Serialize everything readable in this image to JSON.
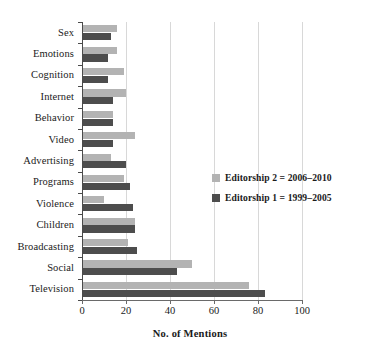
{
  "chart_data": {
    "type": "bar",
    "orientation": "horizontal",
    "title": "",
    "xlabel": "No. of Mentions",
    "ylabel": "",
    "xlim": [
      0,
      100
    ],
    "xticks": [
      0,
      20,
      40,
      60,
      80,
      100
    ],
    "grid": "vertical",
    "legend_position": "right-middle",
    "categories": [
      "Sex",
      "Emotions",
      "Cognition",
      "Internet",
      "Behavior",
      "Video",
      "Advertising",
      "Programs",
      "Violence",
      "Children",
      "Broadcasting",
      "Social",
      "Television"
    ],
    "series": [
      {
        "name": "Editorship 2 = 2006–2010",
        "color": "#b3b3b3",
        "values": [
          16,
          16,
          19,
          20,
          14,
          24,
          13,
          19,
          10,
          24,
          21,
          50,
          76
        ]
      },
      {
        "name": "Editorship 1 = 1999–2005",
        "color": "#4d4d4d",
        "values": [
          13,
          12,
          12,
          14,
          14,
          14,
          20,
          22,
          23,
          24,
          25,
          43,
          83
        ]
      }
    ]
  },
  "legend": {
    "items": [
      {
        "label": "Editorship 2 = 2006–2010",
        "color": "#b3b3b3"
      },
      {
        "label": "Editorship 1 = 1999–2005",
        "color": "#4d4d4d"
      }
    ]
  },
  "axis": {
    "x_title": "No. of Mentions",
    "x_tick_labels": [
      "0",
      "20",
      "40",
      "60",
      "80",
      "100"
    ]
  }
}
